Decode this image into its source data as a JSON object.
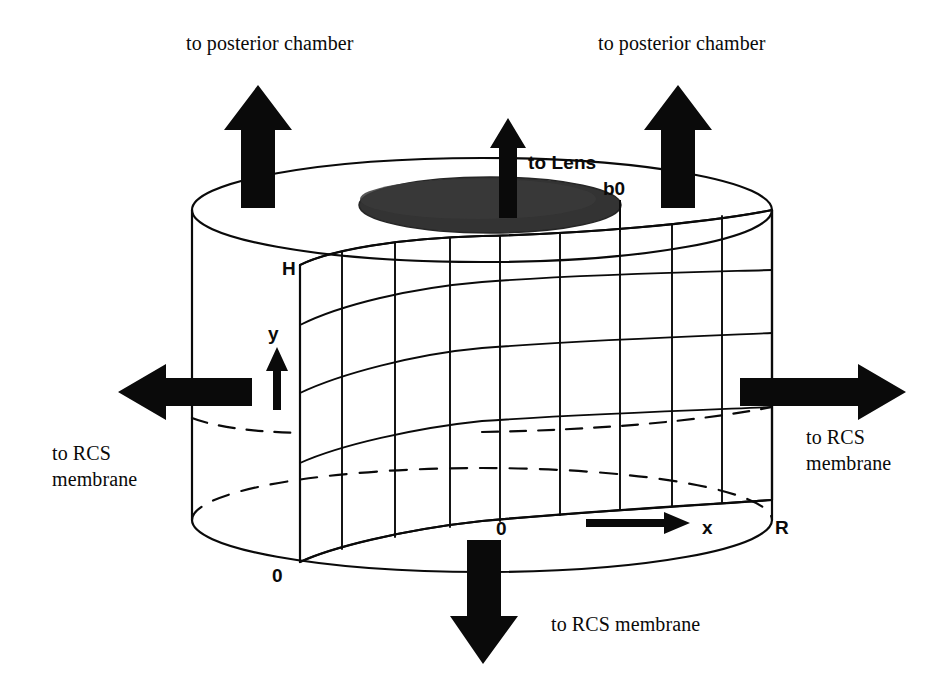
{
  "figure": {
    "type": "schematic-diagram",
    "background_color": "#ffffff",
    "ink_color": "#0a0a0a"
  },
  "flow_labels": {
    "top_left": "to posterior chamber",
    "top_right": "to posterior chamber",
    "top_center": "to Lens",
    "left": "to RCS\nmembrane",
    "left_line1": "to RCS",
    "left_line2": "membrane",
    "right_line1": "to RCS",
    "right_line2": "membrane",
    "bottom": "to RCS membrane"
  },
  "axis_labels": {
    "height_top": "H",
    "height_bottom": "0",
    "vertical_axis": "y",
    "radial_origin": "0",
    "radial_axis": "x",
    "radial_max": "R",
    "boundary_marker": "b0"
  },
  "arrows": [
    {
      "name": "arrow-top-left",
      "direction": "up",
      "label": "to posterior chamber"
    },
    {
      "name": "arrow-top-center",
      "direction": "up",
      "label": "to Lens"
    },
    {
      "name": "arrow-top-right",
      "direction": "up",
      "label": "to posterior chamber"
    },
    {
      "name": "arrow-left",
      "direction": "left",
      "label": "to RCS membrane"
    },
    {
      "name": "arrow-right",
      "direction": "right",
      "label": "to RCS membrane"
    },
    {
      "name": "arrow-bottom",
      "direction": "down",
      "label": "to RCS membrane"
    },
    {
      "name": "arrow-y-axis",
      "direction": "up",
      "label": "y"
    },
    {
      "name": "arrow-x-axis",
      "direction": "right",
      "label": "x"
    }
  ],
  "geometry": {
    "cylinder_left_x": 192,
    "cylinder_right_x": 772,
    "top_ellipse_center_y": 210,
    "bottom_ellipse_center_y": 520,
    "ellipse_ry": 52,
    "mesh_vertical_lines": 10,
    "mesh_horizontal_lines": 5,
    "lens_patch_color": "#333333"
  }
}
